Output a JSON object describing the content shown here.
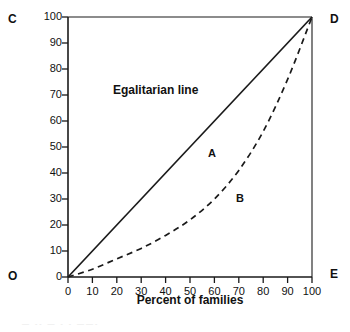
{
  "figure": {
    "corners": {
      "top_left": "C",
      "top_right": "D",
      "bottom_left": "O",
      "bottom_right": "E"
    },
    "annotations": {
      "egalitarian_line": "Egalitarian line",
      "area_between_curves": "A",
      "area_below_curve": "B"
    },
    "axis_title_x": "Percent of families",
    "axis_title_y": ""
  },
  "chart_data": {
    "type": "line",
    "title": "",
    "xlabel": "Percent of families",
    "ylabel": "",
    "xlim": [
      0,
      100
    ],
    "ylim": [
      0,
      100
    ],
    "grid": false,
    "legend_position": "none",
    "xticks": [
      0,
      10,
      20,
      30,
      40,
      50,
      60,
      70,
      80,
      90,
      100
    ],
    "yticks": [
      0,
      10,
      20,
      30,
      40,
      50,
      60,
      70,
      80,
      90,
      100
    ],
    "xtick_labels": [
      "0",
      "10",
      "20",
      "30",
      "40",
      "50",
      "60",
      "70",
      "80",
      "90",
      "100"
    ],
    "ytick_labels": [
      "0",
      "10",
      "20",
      "30",
      "40",
      "50",
      "60",
      "70",
      "80",
      "90",
      "100"
    ],
    "series": [
      {
        "name": "Egalitarian line",
        "style": "solid",
        "color": "#1a1a1a",
        "x": [
          0,
          100
        ],
        "values": [
          0,
          100
        ]
      },
      {
        "name": "Lorenz curve",
        "style": "dashed",
        "color": "#1a1a1a",
        "x": [
          0,
          10,
          20,
          30,
          40,
          50,
          60,
          70,
          80,
          90,
          100
        ],
        "values": [
          0,
          3,
          7,
          11,
          16,
          22,
          30,
          41,
          56,
          76,
          100
        ]
      }
    ],
    "annotations": [
      {
        "text": "Egalitarian line",
        "x": 22,
        "y": 72
      },
      {
        "text": "A",
        "x": 58,
        "y": 47
      },
      {
        "text": "B",
        "x": 70,
        "y": 31
      },
      {
        "text": "C",
        "x": -10,
        "y": 100
      },
      {
        "text": "D",
        "x": 108,
        "y": 100
      },
      {
        "text": "O",
        "x": -10,
        "y": 0
      },
      {
        "text": "E",
        "x": 108,
        "y": 0
      }
    ]
  },
  "scan": {
    "bleed_text": "— -- — - - ——-"
  }
}
